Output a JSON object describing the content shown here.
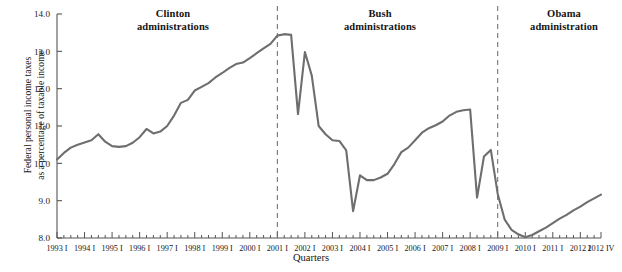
{
  "chart_data": {
    "type": "line",
    "title": "",
    "xlabel": "Quarters",
    "ylabel": "Federal personal income taxes\nas a percentage of taxable income",
    "ylim": [
      8.0,
      14.0
    ],
    "yticks": [
      8.0,
      9.0,
      10.0,
      11.0,
      12.0,
      13.0,
      14.0
    ],
    "ytick_labels": [
      "8.0",
      "9.0",
      "10.0",
      "11.0",
      "12.0",
      "13.0",
      "14.0"
    ],
    "grid": false,
    "legend_position": "none",
    "line_color": "#6e6e6e",
    "axis_color": "#555555",
    "xlim": [
      "1993 I",
      "2012 IV"
    ],
    "xtick_labels": [
      "1993 I",
      "1994 I",
      "1995 I",
      "1996 I",
      "1997 I",
      "1998 I",
      "1999 I",
      "2000 I",
      "2001 I",
      "2002 I",
      "2003 I",
      "2004 I",
      "2005 I",
      "2006 I",
      "2007 I",
      "2008 I",
      "2009 I",
      "2010 I",
      "2011 I",
      "2012 I",
      "2012 IV"
    ],
    "minor_ticks_per_year": 4,
    "annotations": [
      {
        "name": "clinton",
        "text": "Clinton\nadministrations",
        "x_quarter": "1997 I"
      },
      {
        "name": "bush",
        "text": "Bush\nadministrations",
        "x_quarter": "2005 I"
      },
      {
        "name": "obama",
        "text": "Obama\nadministration",
        "x_quarter": "2011 I"
      }
    ],
    "dividers": [
      {
        "name": "clinton-bush-divider",
        "x_quarter": "2001 I",
        "style": "dashed"
      },
      {
        "name": "bush-obama-divider",
        "x_quarter": "2009 I",
        "style": "dashed"
      }
    ],
    "x": [
      "1993 I",
      "1993 II",
      "1993 III",
      "1993 IV",
      "1994 I",
      "1994 II",
      "1994 III",
      "1994 IV",
      "1995 I",
      "1995 II",
      "1995 III",
      "1995 IV",
      "1996 I",
      "1996 II",
      "1996 III",
      "1996 IV",
      "1997 I",
      "1997 II",
      "1997 III",
      "1997 IV",
      "1998 I",
      "1998 II",
      "1998 III",
      "1998 IV",
      "1999 I",
      "1999 II",
      "1999 III",
      "1999 IV",
      "2000 I",
      "2000 II",
      "2000 III",
      "2000 IV",
      "2001 I",
      "2001 II",
      "2001 III",
      "2001 IV",
      "2002 I",
      "2002 II",
      "2002 III",
      "2002 IV",
      "2003 I",
      "2003 II",
      "2003 III",
      "2003 IV",
      "2004 I",
      "2004 II",
      "2004 III",
      "2004 IV",
      "2005 I",
      "2005 II",
      "2005 III",
      "2005 IV",
      "2006 I",
      "2006 II",
      "2006 III",
      "2006 IV",
      "2007 I",
      "2007 II",
      "2007 III",
      "2007 IV",
      "2008 I",
      "2008 II",
      "2008 III",
      "2008 IV",
      "2009 I",
      "2009 II",
      "2009 III",
      "2009 IV",
      "2010 I",
      "2010 II",
      "2010 III",
      "2010 IV",
      "2011 I",
      "2011 II",
      "2011 III",
      "2011 IV",
      "2012 I",
      "2012 II",
      "2012 III",
      "2012 IV"
    ],
    "values": [
      10.1,
      10.28,
      10.42,
      10.5,
      10.56,
      10.62,
      10.78,
      10.58,
      10.46,
      10.44,
      10.46,
      10.55,
      10.7,
      10.92,
      10.8,
      10.85,
      11.0,
      11.28,
      11.62,
      11.7,
      11.95,
      12.05,
      12.15,
      12.3,
      12.42,
      12.55,
      12.66,
      12.7,
      12.82,
      12.95,
      13.08,
      13.2,
      13.42,
      13.46,
      13.44,
      11.32,
      12.98,
      12.35,
      11.0,
      10.78,
      10.62,
      10.6,
      10.35,
      8.72,
      9.68,
      9.55,
      9.55,
      9.62,
      9.72,
      9.98,
      10.3,
      10.42,
      10.62,
      10.82,
      10.94,
      11.02,
      11.12,
      11.28,
      11.38,
      11.42,
      11.44,
      9.08,
      10.18,
      10.36,
      9.18,
      8.5,
      8.22,
      8.1,
      8.02,
      8.08,
      8.18,
      8.28,
      8.4,
      8.52,
      8.62,
      8.74,
      8.84,
      8.96,
      9.06,
      9.16
    ]
  }
}
